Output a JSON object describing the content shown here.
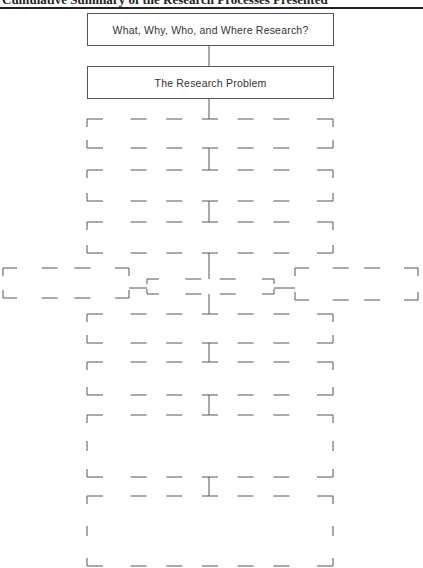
{
  "header": {
    "title": "Cumulative Summary of the Research Processes Presented"
  },
  "diagram": {
    "boxes": [
      {
        "id": "box-1",
        "label": "What, Why, Who, and Where Research?",
        "style": "solid"
      },
      {
        "id": "box-2",
        "label": "The Research Problem",
        "style": "solid"
      },
      {
        "id": "box-3",
        "label": "",
        "style": "dashed"
      },
      {
        "id": "box-4",
        "label": "",
        "style": "dashed"
      },
      {
        "id": "box-5",
        "label": "",
        "style": "dashed"
      },
      {
        "id": "box-6-left",
        "label": "",
        "style": "dashed"
      },
      {
        "id": "box-6-center",
        "label": "",
        "style": "dashed"
      },
      {
        "id": "box-6-right",
        "label": "",
        "style": "dashed"
      },
      {
        "id": "box-7",
        "label": "",
        "style": "dashed"
      },
      {
        "id": "box-8",
        "label": "",
        "style": "dashed"
      },
      {
        "id": "box-9",
        "label": "",
        "style": "dashed"
      },
      {
        "id": "box-10",
        "label": "",
        "style": "dashed"
      }
    ]
  }
}
